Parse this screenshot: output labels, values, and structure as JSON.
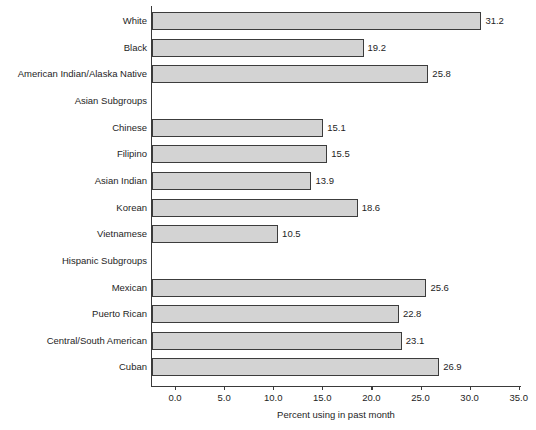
{
  "chart_data": {
    "type": "bar",
    "orientation": "horizontal",
    "title": "",
    "xlabel": "Percent using in past month",
    "ylabel": "",
    "xlim": [
      -2.4,
      35.8
    ],
    "xticks": [
      "0.0",
      "5.0",
      "10.0",
      "15.0",
      "20.0",
      "25.0",
      "30.0",
      "35.0"
    ],
    "xtick_values": [
      0,
      5,
      10,
      15,
      20,
      25,
      30,
      35
    ],
    "grid": false,
    "legend": null,
    "bar_fill_color": "#d3d3d3",
    "bar_border_color": "#3c3c3c",
    "axis_color": "#3a3a3a",
    "categories": [
      "White",
      "Black",
      "American Indian/Alaska Native",
      "Asian Subgroups",
      "Chinese",
      "Filipino",
      "Asian Indian",
      "Korean",
      "Vietnamese",
      "Hispanic Subgroups",
      "Mexican",
      "Puerto Rican",
      "Central/South American",
      "Cuban"
    ],
    "values": [
      31.2,
      19.2,
      25.8,
      null,
      15.1,
      15.5,
      13.9,
      18.6,
      10.5,
      null,
      25.6,
      22.8,
      23.1,
      26.9
    ],
    "value_labels": [
      "31.2",
      "19.2",
      "25.8",
      "",
      "15.1",
      "15.5",
      "13.9",
      "18.6",
      "10.5",
      "",
      "25.6",
      "22.8",
      "23.1",
      "26.9"
    ],
    "header_rows": [
      "Asian Subgroups",
      "Hispanic Subgroups"
    ]
  }
}
